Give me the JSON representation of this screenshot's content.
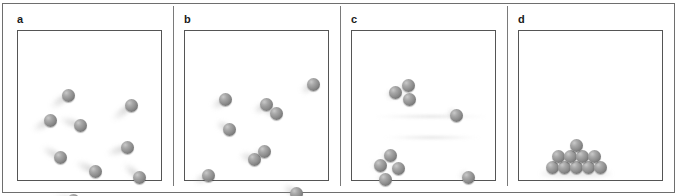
{
  "figure": {
    "background_color": "#ffffff",
    "frame_color": "#6e6e6e",
    "sphere_color": "#8d8d8d",
    "sphere_highlight": "#c9c9c9",
    "panel_count": 4
  },
  "panels": [
    {
      "label": "a",
      "name": "panel-a",
      "description": "Nine separated spheres in rapid motion with long blur trails",
      "sphere_count": 9,
      "state": "gas",
      "motion": "fast",
      "spheres": [
        {
          "x": 44,
          "y": 58,
          "trail": {
            "angle": -35,
            "length": 22
          }
        },
        {
          "x": 26,
          "y": 83,
          "trail": {
            "angle": -30,
            "length": 20
          }
        },
        {
          "x": 56,
          "y": 88,
          "trail": {
            "angle": 18,
            "length": 22
          }
        },
        {
          "x": 107,
          "y": 68,
          "trail": {
            "angle": -38,
            "length": 24
          }
        },
        {
          "x": 103,
          "y": 110,
          "trail": {
            "angle": -18,
            "length": 22
          }
        },
        {
          "x": 36,
          "y": 120,
          "trail": {
            "angle": 30,
            "length": 21
          }
        },
        {
          "x": 71,
          "y": 134,
          "trail": {
            "angle": 26,
            "length": 22
          }
        },
        {
          "x": 115,
          "y": 140,
          "trail": {
            "angle": 42,
            "length": 21
          }
        },
        {
          "x": 49,
          "y": 163,
          "trail": {
            "angle": 8,
            "length": 20
          }
        }
      ]
    },
    {
      "label": "b",
      "name": "panel-b",
      "description": "Nine spheres, two touching pairs and five singles, shorter blur trails",
      "sphere_count": 9,
      "state": "gas-colliding",
      "motion": "moderate",
      "spheres": [
        {
          "x": 34,
          "y": 62,
          "trail": {
            "angle": -34,
            "length": 16
          }
        },
        {
          "x": 75,
          "y": 67,
          "trail": {
            "angle": -34,
            "length": 15
          }
        },
        {
          "x": 85,
          "y": 76,
          "trail": {
            "angle": 22,
            "length": 17
          }
        },
        {
          "x": 122,
          "y": 47,
          "trail": {
            "angle": -34,
            "length": 15
          }
        },
        {
          "x": 38,
          "y": 92,
          "trail": {
            "angle": 30,
            "length": 15
          }
        },
        {
          "x": 63,
          "y": 122,
          "trail": {
            "angle": 20,
            "length": 16
          }
        },
        {
          "x": 73,
          "y": 114,
          "trail": {
            "angle": -30,
            "length": 14
          }
        },
        {
          "x": 17,
          "y": 138,
          "trail": {
            "angle": -28,
            "length": 16
          }
        },
        {
          "x": 105,
          "y": 156,
          "trail": {
            "angle": 30,
            "length": 15
          }
        }
      ]
    },
    {
      "label": "c",
      "name": "panel-c",
      "description": "Nine spheres: a cluster of three, a cluster of four, and two singles with faint streaks",
      "sphere_count": 9,
      "state": "condensing",
      "motion": "slow",
      "spheres": [
        {
          "x": 37,
          "y": 55,
          "trail": {
            "angle": -30,
            "length": 10
          }
        },
        {
          "x": 50,
          "y": 48,
          "trail": {
            "angle": -35,
            "length": 12
          }
        },
        {
          "x": 51,
          "y": 62,
          "trail": {
            "angle": 10,
            "length": 8
          }
        },
        {
          "x": 98,
          "y": 78,
          "trail": {
            "angle": 30,
            "length": 10
          }
        },
        {
          "x": 32,
          "y": 118,
          "trail": {
            "angle": -20,
            "length": 9
          }
        },
        {
          "x": 22,
          "y": 128,
          "trail": {
            "angle": -10,
            "length": 8
          }
        },
        {
          "x": 40,
          "y": 131,
          "trail": {
            "angle": 12,
            "length": 8
          }
        },
        {
          "x": 27,
          "y": 142,
          "trail": {
            "angle": 16,
            "length": 8
          }
        },
        {
          "x": 110,
          "y": 140,
          "trail": {
            "angle": 28,
            "length": 10
          }
        }
      ],
      "streaks": [
        {
          "x": 20,
          "y": 84,
          "width": 118
        },
        {
          "x": 30,
          "y": 105,
          "width": 100
        }
      ]
    },
    {
      "label": "d",
      "name": "panel-d",
      "description": "Ten spheres settled in a stationary pile at the bottom of the box, no motion trails",
      "sphere_count": 10,
      "state": "solid-pile",
      "motion": "none",
      "spheres": [
        {
          "x": 27,
          "y": 130,
          "trail": null
        },
        {
          "x": 39,
          "y": 130,
          "trail": null
        },
        {
          "x": 51,
          "y": 130,
          "trail": null
        },
        {
          "x": 63,
          "y": 130,
          "trail": null
        },
        {
          "x": 75,
          "y": 130,
          "trail": null
        },
        {
          "x": 33,
          "y": 119,
          "trail": null
        },
        {
          "x": 45,
          "y": 119,
          "trail": null
        },
        {
          "x": 57,
          "y": 119,
          "trail": null
        },
        {
          "x": 69,
          "y": 119,
          "trail": null
        },
        {
          "x": 51,
          "y": 108,
          "trail": null
        }
      ]
    }
  ]
}
